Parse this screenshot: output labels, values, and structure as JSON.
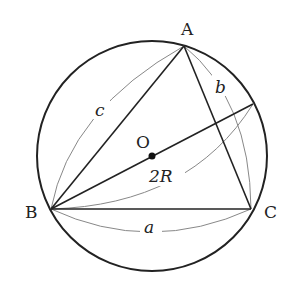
{
  "diagram": {
    "title": "",
    "type": "inscribed-triangle-circumcircle",
    "colors": {
      "stroke": "#222222",
      "guide": "#888888",
      "background": "#ffffff"
    },
    "circle": {
      "cx": 152,
      "cy": 156,
      "r": 115
    },
    "center": {
      "label": "O",
      "x": 152,
      "y": 156
    },
    "vertices": {
      "A": {
        "label": "A",
        "x": 184,
        "y": 46
      },
      "B": {
        "label": "B",
        "x": 51,
        "y": 209
      },
      "C": {
        "label": "C",
        "x": 251,
        "y": 209
      }
    },
    "diameter_end": {
      "x": 253,
      "y": 104
    },
    "side_labels": {
      "a": "a",
      "b": "b",
      "c": "c",
      "diameter": "2R"
    }
  }
}
